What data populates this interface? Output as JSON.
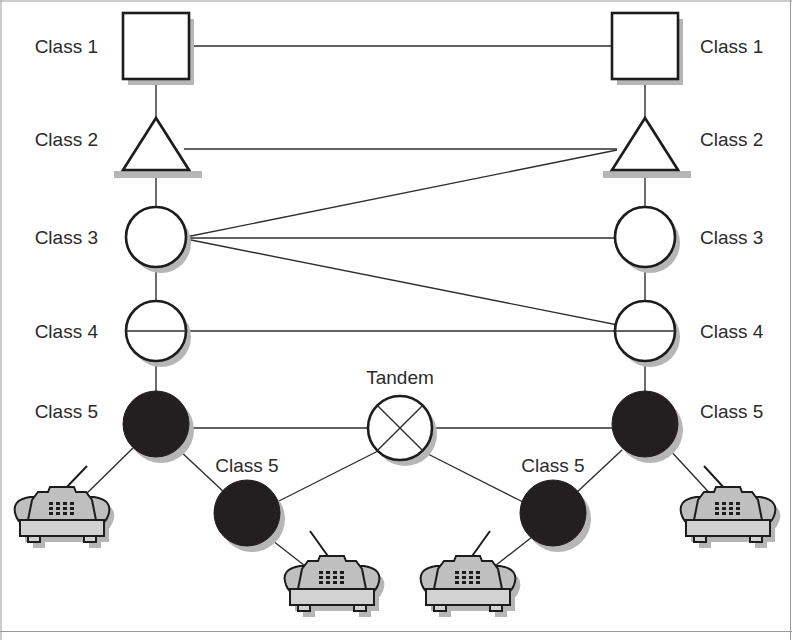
{
  "diagram": {
    "colors": {
      "ink": "#1c1c1c",
      "edge": "#2e2e2e",
      "filled_node": "#231f20",
      "shadow": "#b6b6b6",
      "phone_gray": "#bfbfbf",
      "background": "#ffffff"
    },
    "labels": {
      "class1_left": "Class 1",
      "class1_right": "Class 1",
      "class2_left": "Class 2",
      "class2_right": "Class 2",
      "class3_left": "Class 3",
      "class3_right": "Class 3",
      "class4_left": "Class 4",
      "class4_right": "Class 4",
      "class5_left": "Class 5",
      "class5_right": "Class 5",
      "class5_mid_left": "Class 5",
      "class5_mid_right": "Class 5",
      "tandem": "Tandem"
    },
    "nodes": [
      {
        "id": "class1-left",
        "shape": "square",
        "label": "Class 1",
        "x": 156,
        "y": 46,
        "size": 66
      },
      {
        "id": "class1-right",
        "shape": "square",
        "label": "Class 1",
        "x": 645,
        "y": 46,
        "size": 66
      },
      {
        "id": "class2-left",
        "shape": "triangle",
        "label": "Class 2",
        "x": 156,
        "y": 146,
        "size": 62
      },
      {
        "id": "class2-right",
        "shape": "triangle",
        "label": "Class 2",
        "x": 645,
        "y": 146,
        "size": 62
      },
      {
        "id": "class3-left",
        "shape": "circle",
        "label": "Class 3",
        "x": 156,
        "y": 237,
        "size": 30
      },
      {
        "id": "class3-right",
        "shape": "circle",
        "label": "Class 3",
        "x": 645,
        "y": 237,
        "size": 30
      },
      {
        "id": "class4-left",
        "shape": "circle-split",
        "label": "Class 4",
        "x": 156,
        "y": 331,
        "size": 30
      },
      {
        "id": "class4-right",
        "shape": "circle-split",
        "label": "Class 4",
        "x": 645,
        "y": 331,
        "size": 30
      },
      {
        "id": "class5-left",
        "shape": "circle-solid",
        "label": "Class 5",
        "x": 156,
        "y": 424,
        "size": 33
      },
      {
        "id": "class5-right",
        "shape": "circle-solid",
        "label": "Class 5",
        "x": 645,
        "y": 424,
        "size": 33
      },
      {
        "id": "tandem",
        "shape": "circle-cross",
        "label": "Tandem",
        "x": 400,
        "y": 428,
        "size": 32
      },
      {
        "id": "class5-mid-left",
        "shape": "circle-solid",
        "label": "Class 5",
        "x": 247,
        "y": 513,
        "size": 33
      },
      {
        "id": "class5-mid-right",
        "shape": "circle-solid",
        "label": "Class 5",
        "x": 553,
        "y": 513,
        "size": 33
      }
    ],
    "phones": [
      {
        "id": "phone-far-left",
        "x": 62,
        "y": 524
      },
      {
        "id": "phone-mid-left",
        "x": 332,
        "y": 593
      },
      {
        "id": "phone-mid-right",
        "x": 468,
        "y": 593
      },
      {
        "id": "phone-far-right",
        "x": 728,
        "y": 524
      }
    ],
    "edges": [
      {
        "from": "class1-left",
        "to": "class1-right",
        "kind": "horizontal"
      },
      {
        "from": "class1-left",
        "to": "class2-left",
        "kind": "vertical"
      },
      {
        "from": "class1-right",
        "to": "class2-right",
        "kind": "vertical"
      },
      {
        "from": "class2-left",
        "to": "class2-right",
        "kind": "horizontal"
      },
      {
        "from": "class2-left",
        "to": "class3-left",
        "kind": "vertical"
      },
      {
        "from": "class2-right",
        "to": "class3-right",
        "kind": "vertical"
      },
      {
        "from": "class3-left",
        "to": "class2-right",
        "kind": "diagonal"
      },
      {
        "from": "class3-left",
        "to": "class3-right",
        "kind": "horizontal"
      },
      {
        "from": "class3-left",
        "to": "class4-right",
        "kind": "diagonal"
      },
      {
        "from": "class3-left",
        "to": "class4-left",
        "kind": "vertical"
      },
      {
        "from": "class3-right",
        "to": "class4-right",
        "kind": "vertical"
      },
      {
        "from": "class4-left",
        "to": "class4-right",
        "kind": "horizontal"
      },
      {
        "from": "class4-left",
        "to": "class5-left",
        "kind": "vertical"
      },
      {
        "from": "class4-right",
        "to": "class5-right",
        "kind": "vertical"
      },
      {
        "from": "class5-left",
        "to": "tandem",
        "kind": "horizontal"
      },
      {
        "from": "tandem",
        "to": "class5-right",
        "kind": "horizontal"
      },
      {
        "from": "class5-left",
        "to": "class5-mid-left",
        "kind": "diagonal"
      },
      {
        "from": "tandem",
        "to": "class5-mid-left",
        "kind": "diagonal"
      },
      {
        "from": "tandem",
        "to": "class5-mid-right",
        "kind": "diagonal"
      },
      {
        "from": "class5-right",
        "to": "class5-mid-right",
        "kind": "diagonal"
      },
      {
        "from": "class5-left",
        "to": "phone-far-left",
        "kind": "diagonal"
      },
      {
        "from": "class5-mid-left",
        "to": "phone-mid-left",
        "kind": "diagonal"
      },
      {
        "from": "class5-mid-right",
        "to": "phone-mid-right",
        "kind": "diagonal"
      },
      {
        "from": "class5-right",
        "to": "phone-far-right",
        "kind": "diagonal"
      }
    ]
  }
}
